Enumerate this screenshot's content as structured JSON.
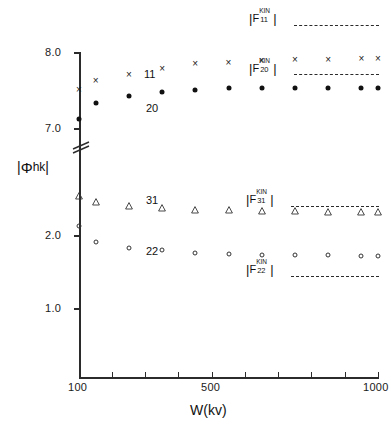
{
  "chart_data": {
    "type": "scatter",
    "title": "",
    "xlabel": "W(kv)",
    "ylabel": "|Φhk|",
    "ylabel_parts": {
      "bar_left": "|",
      "symbol": "Φ",
      "sub": "hk",
      "bar_right": "|"
    },
    "xlim": [
      100,
      1000
    ],
    "xticks": [
      100,
      200,
      300,
      400,
      500,
      600,
      700,
      800,
      900,
      1000
    ],
    "xticklabels": [
      "100",
      "",
      "",
      "",
      "500",
      "",
      "",
      "",
      "",
      "1000"
    ],
    "x_scale": "linear",
    "grid": false,
    "broken_y_axis": true,
    "y_lower_segment": {
      "ticks": [
        1.0,
        2.0
      ],
      "ticklabels": [
        "1.0",
        "2.0"
      ]
    },
    "y_upper_segment": {
      "ticks": [
        7.0,
        8.0
      ],
      "ticklabels": [
        "7.0",
        "8.0"
      ]
    },
    "yticklabels_all": [
      "1.0",
      "2.0",
      "7.0",
      "8.0"
    ],
    "legend_position": "inside-right",
    "series": [
      {
        "name": "11",
        "label": "11",
        "marker": "x",
        "kin_label": {
          "prefix": "|F",
          "sup": "KIN",
          "sub": "11",
          "suffix": "|"
        },
        "kin_value": 8.05,
        "x": [
          100,
          150,
          250,
          350,
          450,
          550,
          650,
          750,
          850,
          950,
          1000
        ],
        "y": [
          7.5,
          7.62,
          7.7,
          7.78,
          7.84,
          7.86,
          7.88,
          7.9,
          7.9,
          7.91,
          7.91
        ]
      },
      {
        "name": "20",
        "label": "20",
        "marker": "filled-circle",
        "kin_label": {
          "prefix": "|F",
          "sup": "KIN",
          "sub": "20",
          "suffix": "|"
        },
        "kin_value": 7.72,
        "x": [
          100,
          150,
          250,
          350,
          450,
          550,
          650,
          750,
          850,
          950,
          1000
        ],
        "y": [
          7.12,
          7.33,
          7.42,
          7.47,
          7.5,
          7.52,
          7.52,
          7.53,
          7.53,
          7.53,
          7.53
        ]
      },
      {
        "name": "31",
        "label": "31",
        "marker": "open-triangle",
        "kin_label": {
          "prefix": "|F",
          "sup": "KIN",
          "sub": "31",
          "suffix": "|"
        },
        "kin_value": 2.24,
        "x": [
          100,
          150,
          250,
          350,
          450,
          550,
          650,
          750,
          850,
          950,
          1000
        ],
        "y": [
          2.62,
          2.54,
          2.48,
          2.45,
          2.43,
          2.42,
          2.41,
          2.41,
          2.4,
          2.4,
          2.4
        ]
      },
      {
        "name": "22",
        "label": "22",
        "marker": "open-circle",
        "kin_label": {
          "prefix": "|F",
          "sup": "KIN",
          "sub": "22",
          "suffix": "|"
        },
        "kin_value": 1.4,
        "x": [
          100,
          150,
          250,
          350,
          450,
          550,
          650,
          750,
          850,
          950,
          1000
        ],
        "y": [
          2.13,
          1.9,
          1.82,
          1.79,
          1.76,
          1.74,
          1.73,
          1.72,
          1.72,
          1.71,
          1.71
        ]
      }
    ]
  },
  "axis": {
    "y_title_bar_left": "|",
    "y_title_symbol": "Φ",
    "y_title_sub": "hk",
    "y_title_bar_right": "|",
    "x_title": "W(kv)",
    "x_tick_100": "100",
    "x_tick_500": "500",
    "x_tick_1000": "1000",
    "y_tick_80": "8.0",
    "y_tick_70": "7.0",
    "y_tick_20": "2.0",
    "y_tick_10": "1.0"
  },
  "series_tags": {
    "tag_11": "11",
    "tag_20": "20",
    "tag_31": "31",
    "tag_22": "22"
  },
  "legend": {
    "bar": "|",
    "f": "F",
    "kin": "KIN",
    "sub_11": "11",
    "sub_20": "20",
    "sub_31": "31",
    "sub_22": "22"
  },
  "colors": {
    "ink": "#1a1a1a",
    "axis": "#2b2b2b",
    "background": "#ffffff"
  }
}
